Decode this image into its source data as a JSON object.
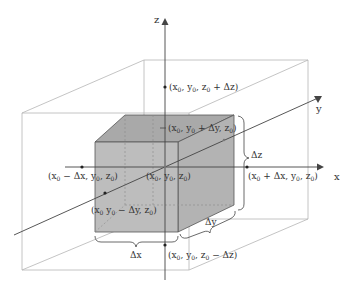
{
  "figure": {
    "type": "3d-coordinate-diagram"
  },
  "colors": {
    "cube_fill": "#bdbdbd",
    "cube_top_fill": "#a9a9a9",
    "cube_edge": "#555555",
    "outer_box": "#b5b5b5",
    "axis": "#444444",
    "text": "#333333"
  },
  "axes": {
    "x": {
      "label": "x"
    },
    "y": {
      "label": "y"
    },
    "z": {
      "label": "z"
    }
  },
  "points": {
    "center": {
      "label": "(x0, y0, z0)",
      "main": "(x",
      "s1": "0",
      "m2": ", y",
      "s2": "0",
      "m3": ", z",
      "s3": "0",
      "m4": ")"
    },
    "x_plus": {
      "label": "(x0 + Δx, y0, z0)",
      "main": "(x",
      "s1": "0",
      "m2": " + Δx, y",
      "s2": "0",
      "m3": ", z",
      "s3": "0",
      "m4": ")"
    },
    "x_minus": {
      "label": "(x0 − Δx, y0, z0)",
      "main": "(x",
      "s1": "0",
      "m2": " − Δx, y",
      "s2": "0",
      "m3": ", z",
      "s3": "0",
      "m4": ")"
    },
    "y_plus": {
      "label": "(x0, y0 + Δy, z0)",
      "main": "(x",
      "s1": "0",
      "m2": ", y",
      "s2": "0",
      "m3": " + Δy, z",
      "s3": "0",
      "m4": ")"
    },
    "y_minus": {
      "label": "(x0, y0 − Δy, z0)",
      "main": "(x",
      "s1": "0",
      "m2": " y",
      "s2": "0",
      "m3": " − Δy, z",
      "s3": "0",
      "m4": ")"
    },
    "z_plus": {
      "label": "(x0, y0, z0 + Δz)",
      "main": "(x",
      "s1": "0",
      "m2": ", y",
      "s2": "0",
      "m3": ", z",
      "s3": "0",
      "m4": " + Δz)"
    },
    "z_minus": {
      "label": "(x0, y0, z0 − Δz)",
      "main": "(x",
      "s1": "0",
      "m2": ", y",
      "s2": "0",
      "m3": ", z",
      "s3": "0",
      "m4": " − Δz)"
    }
  },
  "dimensions": {
    "dx": "Δx",
    "dy": "Δy",
    "dz": "Δz"
  }
}
